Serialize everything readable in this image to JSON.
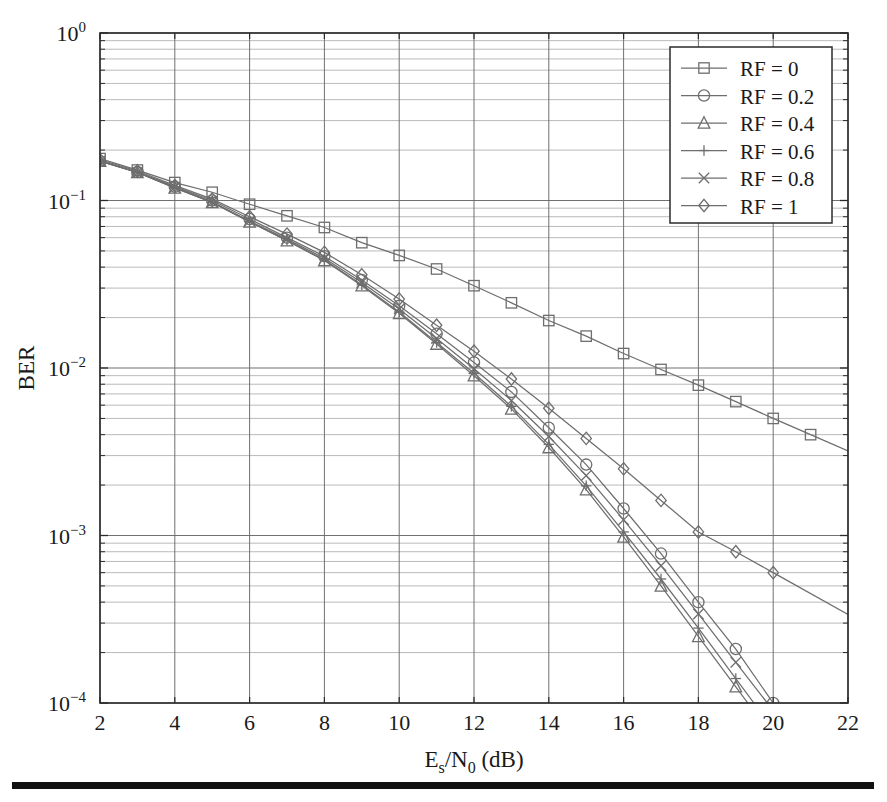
{
  "figure": {
    "background_color": "#ffffff",
    "axes_color": "#2b2b2b",
    "grid_major_color": "#707070",
    "grid_minor_color": "#a8a8a8",
    "series_color": "#6e6e6e",
    "bottom_rule": true
  },
  "chart_data": {
    "type": "line",
    "title": "",
    "xlabel": "E_s/N_0 (dB)",
    "xlabel_parts": {
      "lead": "E",
      "sub1": "s",
      "mid": "/N",
      "sub2": "0",
      "tail": " (dB)"
    },
    "ylabel": "BER",
    "xlim": [
      2,
      22
    ],
    "ylim": [
      0.0001,
      1
    ],
    "yscale": "log",
    "xscale": "linear",
    "xticks": [
      2,
      4,
      6,
      8,
      10,
      12,
      14,
      16,
      18,
      20,
      22
    ],
    "xticklabels": [
      "2",
      "4",
      "6",
      "8",
      "10",
      "12",
      "14",
      "16",
      "18",
      "20",
      "22"
    ],
    "yticks": [
      1,
      0.1,
      0.01,
      0.001,
      0.0001
    ],
    "yticklabels": [
      "10^0",
      "10^-1",
      "10^-2",
      "10^-3",
      "10^-4"
    ],
    "ytick_parts": [
      {
        "base": "10",
        "exp": "0"
      },
      {
        "base": "10",
        "exp": "−1"
      },
      {
        "base": "10",
        "exp": "−2"
      },
      {
        "base": "10",
        "exp": "−3"
      },
      {
        "base": "10",
        "exp": "−4"
      }
    ],
    "grid": true,
    "grid_which": "both",
    "legend_position": "upper right",
    "legend_entries": [
      "RF = 0",
      "RF = 0.2",
      "RF = 0.4",
      "RF = 0.6",
      "RF = 0.8",
      "RF = 1"
    ],
    "x": [
      2,
      3,
      4,
      5,
      6,
      7,
      8,
      9,
      10,
      11,
      12,
      13,
      14,
      15,
      16,
      17,
      18,
      19,
      20,
      21
    ],
    "series": [
      {
        "name": "RF = 0",
        "marker": "square",
        "values": [
          0.178,
          0.152,
          0.128,
          0.112,
          0.095,
          0.081,
          0.069,
          0.056,
          0.047,
          0.039,
          0.031,
          0.0245,
          0.0192,
          0.0155,
          0.0122,
          0.0098,
          0.0079,
          0.0063,
          0.005,
          0.004
        ]
      },
      {
        "name": "RF = 0.2",
        "marker": "circle",
        "values": [
          0.172,
          0.148,
          0.121,
          0.1,
          0.0775,
          0.06,
          0.0465,
          0.0335,
          0.0235,
          0.016,
          0.0108,
          0.0072,
          0.0044,
          0.00265,
          0.00145,
          0.00078,
          0.0004,
          0.00021,
          0.0001,
          null
        ]
      },
      {
        "name": "RF = 0.4",
        "marker": "triangle",
        "values": [
          0.172,
          0.147,
          0.119,
          0.0975,
          0.0745,
          0.0575,
          0.0438,
          0.031,
          0.0212,
          0.0139,
          0.009,
          0.0057,
          0.00335,
          0.00188,
          0.00098,
          0.0005,
          0.00025,
          0.000125,
          null,
          null
        ]
      },
      {
        "name": "RF = 0.6",
        "marker": "plus",
        "values": [
          0.172,
          0.147,
          0.119,
          0.0975,
          0.0748,
          0.0578,
          0.0442,
          0.0314,
          0.0216,
          0.0142,
          0.0093,
          0.0059,
          0.0035,
          0.00198,
          0.00105,
          0.00055,
          0.00028,
          0.00014,
          null,
          null
        ]
      },
      {
        "name": "RF = 0.8",
        "marker": "x",
        "values": [
          0.172,
          0.147,
          0.12,
          0.098,
          0.0755,
          0.0588,
          0.0452,
          0.0324,
          0.0225,
          0.015,
          0.0099,
          0.0064,
          0.0039,
          0.00228,
          0.00124,
          0.00066,
          0.00034,
          0.000175,
          null,
          null
        ]
      },
      {
        "name": "RF = 1",
        "marker": "diamond",
        "values": [
          0.175,
          0.15,
          0.123,
          0.102,
          0.08,
          0.063,
          0.049,
          0.036,
          0.0258,
          0.018,
          0.0126,
          0.0086,
          0.00575,
          0.0038,
          0.0025,
          0.00162,
          0.00105,
          0.0008,
          0.0006,
          null
        ]
      }
    ]
  }
}
